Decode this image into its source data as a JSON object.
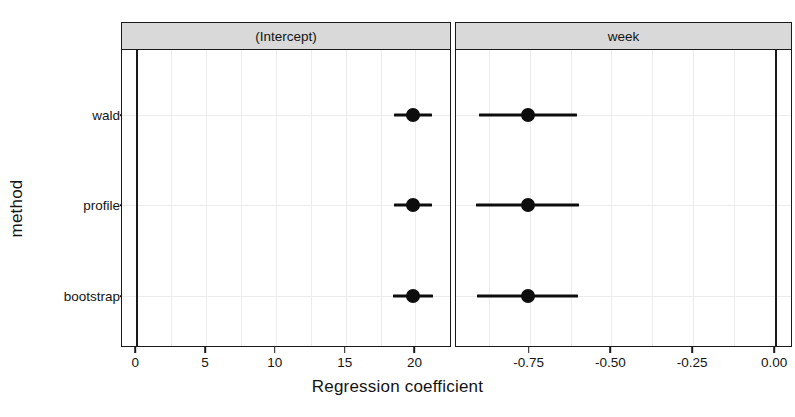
{
  "chart_data": {
    "type": "scatter",
    "plot_style": "dot-and-whisker coefficient plot, faceted",
    "title": "",
    "xlabel": "Regression coefficient",
    "ylabel": "method",
    "categories": [
      "bootstrap",
      "profile",
      "wald"
    ],
    "facets": [
      {
        "label": "(Intercept)",
        "xlim": [
          -0.9,
          22.5
        ],
        "xticks": [
          0,
          5,
          10,
          15,
          20
        ],
        "xticklabels": [
          "0",
          "5",
          "10",
          "15",
          "20"
        ],
        "reference_line": 0,
        "points": [
          {
            "method": "wald",
            "estimate": 19.82,
            "low": 18.45,
            "high": 21.2
          },
          {
            "method": "profile",
            "estimate": 19.82,
            "low": 18.48,
            "high": 21.18
          },
          {
            "method": "bootstrap",
            "estimate": 19.82,
            "low": 18.4,
            "high": 21.22
          }
        ]
      },
      {
        "label": "week",
        "xlim": [
          -0.97,
          0.05
        ],
        "xticks": [
          -0.75,
          -0.5,
          -0.25,
          0.0
        ],
        "xticklabels": [
          "-0.75",
          "-0.50",
          "-0.25",
          "0.00"
        ],
        "reference_line": 0,
        "points": [
          {
            "method": "wald",
            "estimate": -0.755,
            "low": -0.905,
            "high": -0.605
          },
          {
            "method": "profile",
            "estimate": -0.755,
            "low": -0.915,
            "high": -0.6
          },
          {
            "method": "bootstrap",
            "estimate": -0.755,
            "low": -0.91,
            "high": -0.603
          }
        ]
      }
    ],
    "grid": true,
    "legend": "none",
    "colors": {
      "point": "#0d0d0d",
      "errorbar": "#0d0d0d",
      "strip_background": "#d9d9d9",
      "panel_border": "#1a1a1a",
      "grid": "#ececec",
      "reference_line": "#1a1a1a",
      "text": "#141414",
      "background": "#ffffff"
    }
  },
  "layout": {
    "panels": [
      {
        "left": 121,
        "top": 22,
        "width": 330,
        "height": 325
      },
      {
        "left": 455,
        "top": 22,
        "width": 337,
        "height": 325
      }
    ],
    "ytick_px": [
      115,
      205,
      296
    ]
  }
}
